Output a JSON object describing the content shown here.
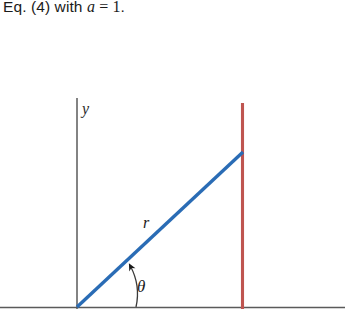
{
  "caption": {
    "prefix": "Eq. (4) with ",
    "variable": "a",
    "operator": " = ",
    "value": "1",
    "suffix": "."
  },
  "figure": {
    "y_axis_label": "y",
    "radius_label": "r",
    "angle_label": "θ",
    "colors": {
      "ray": "#2a6cb5",
      "vertical_line": "#bf5550",
      "axis": "#5a5a5a",
      "text": "#1b1b1b"
    },
    "geometry": {
      "origin_x": 77,
      "origin_y": 307,
      "y_axis_top_y": 98,
      "ray_end_x": 243,
      "ray_end_y": 152,
      "vertical_line_x": 242,
      "vertical_line_top_y": 103,
      "vertical_line_bottom_y": 309,
      "x_axis_y": 307,
      "x_axis_start_x": 0,
      "x_axis_end_x": 345,
      "arc_radius": 59
    }
  }
}
